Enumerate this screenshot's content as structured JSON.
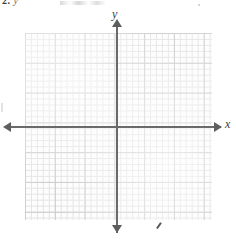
{
  "page": {
    "background_color": "#ffffff",
    "width": 236,
    "height": 240
  },
  "header": {
    "problem_number": "2.",
    "trailing_variable": "y"
  },
  "graph": {
    "x_axis_label": "x",
    "y_axis_label": "y",
    "axis_color": "#6a6a6a",
    "arrow_color": "#5e5e5e",
    "grid_minor_color": "#e2e2e2",
    "grid_major_color": "#c9c9c9",
    "grid_background": "#fdfdfd",
    "has_tick_numbers": false,
    "has_plotted_curve": false
  },
  "chart_data": {
    "type": "scatter",
    "title": "",
    "subtitle": "",
    "xlabel": "x",
    "ylabel": "y",
    "series": [
      {
        "name": "",
        "x": [],
        "y": []
      }
    ],
    "xlim": [
      -15,
      16
    ],
    "ylim": [
      -17,
      16
    ],
    "xticks": [],
    "yticks": [],
    "grid": true,
    "grid_minor_step": 1,
    "grid_major_step": 5,
    "legend": "none",
    "annotations": []
  },
  "artifacts": {
    "stray_pencil_mark": "/",
    "edge_speck": ""
  }
}
